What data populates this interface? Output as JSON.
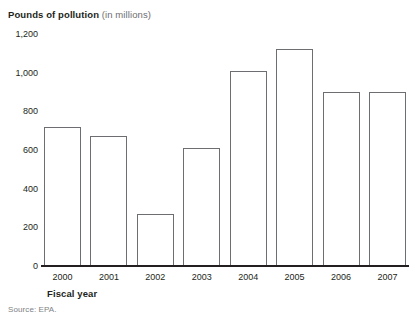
{
  "title": {
    "main": "Pounds of pollution",
    "sub": "(in millions)"
  },
  "axis": {
    "x_title": "Fiscal year",
    "y_ticks": [
      "1,200",
      "1,000",
      "800",
      "600",
      "400",
      "200",
      "0"
    ]
  },
  "source": "Source: EPA.",
  "colors": {
    "text": "#231f20",
    "muted": "#6d6e71",
    "bar_fill": "#ffffff",
    "bar_stroke": "#6d6e71",
    "baseline": "#231f20"
  },
  "chart_data": {
    "type": "bar",
    "title": "Pounds of pollution (in millions)",
    "xlabel": "Fiscal year",
    "ylabel": "Pounds of pollution (in millions)",
    "categories": [
      "2000",
      "2001",
      "2002",
      "2003",
      "2004",
      "2005",
      "2006",
      "2007"
    ],
    "values": [
      720,
      670,
      270,
      610,
      1010,
      1120,
      900,
      900
    ],
    "ylim": [
      0,
      1200
    ],
    "ytick_values": [
      0,
      200,
      400,
      600,
      800,
      1000,
      1200
    ],
    "ytick_labels": [
      "0",
      "200",
      "400",
      "600",
      "800",
      "1,000",
      "1,200"
    ],
    "grid": false,
    "legend": null,
    "source": "Source: EPA."
  }
}
